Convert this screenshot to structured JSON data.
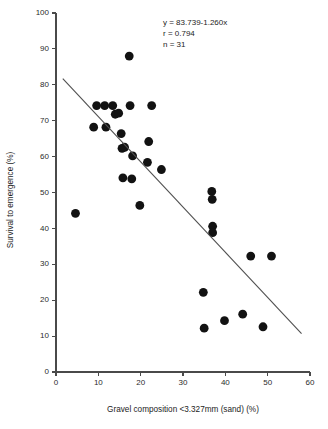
{
  "chart_data": {
    "type": "scatter",
    "title": "",
    "xlabel": "Gravel composition <3.327mm (sand) (%)",
    "ylabel": "Survival to emergence (%)",
    "xlim": [
      0,
      60
    ],
    "ylim": [
      0,
      100
    ],
    "xticks": [
      0,
      10,
      20,
      30,
      40,
      50,
      60
    ],
    "yticks": [
      0,
      10,
      20,
      30,
      40,
      50,
      60,
      70,
      80,
      90,
      100
    ],
    "grid": false,
    "legend": null,
    "marker": {
      "shape": "circle",
      "color": "#121212",
      "size": 4.4
    },
    "points": [
      {
        "x": 4.6,
        "y": 44.2
      },
      {
        "x": 8.9,
        "y": 68.2
      },
      {
        "x": 9.6,
        "y": 74.2
      },
      {
        "x": 11.5,
        "y": 74.2
      },
      {
        "x": 11.8,
        "y": 68.2
      },
      {
        "x": 13.4,
        "y": 74.2
      },
      {
        "x": 14.0,
        "y": 71.8
      },
      {
        "x": 14.8,
        "y": 72.1
      },
      {
        "x": 15.4,
        "y": 66.4
      },
      {
        "x": 15.6,
        "y": 62.3
      },
      {
        "x": 15.8,
        "y": 54.1
      },
      {
        "x": 16.2,
        "y": 62.6
      },
      {
        "x": 17.3,
        "y": 88.0
      },
      {
        "x": 17.5,
        "y": 74.2
      },
      {
        "x": 17.9,
        "y": 53.8
      },
      {
        "x": 18.1,
        "y": 60.2
      },
      {
        "x": 19.8,
        "y": 46.4
      },
      {
        "x": 21.6,
        "y": 58.4
      },
      {
        "x": 21.9,
        "y": 64.2
      },
      {
        "x": 22.6,
        "y": 74.2
      },
      {
        "x": 24.9,
        "y": 56.4
      },
      {
        "x": 34.8,
        "y": 22.2
      },
      {
        "x": 35.0,
        "y": 12.2
      },
      {
        "x": 36.8,
        "y": 50.3
      },
      {
        "x": 36.9,
        "y": 48.1
      },
      {
        "x": 37.0,
        "y": 40.6
      },
      {
        "x": 37.0,
        "y": 38.8
      },
      {
        "x": 39.8,
        "y": 14.3
      },
      {
        "x": 44.1,
        "y": 16.1
      },
      {
        "x": 46.0,
        "y": 32.3
      },
      {
        "x": 48.9,
        "y": 12.6
      },
      {
        "x": 50.9,
        "y": 32.3
      }
    ],
    "fit_line": {
      "equation": "y = 83.739-1.260x",
      "slope": -1.26,
      "intercept": 83.739,
      "x_start": 1.6,
      "x_end": 58.0,
      "color": "#4f4f4f"
    },
    "annotations": {
      "equation": "y = 83.739-1.260x",
      "correlation": "r = 0.794",
      "sample_size": "n = 31",
      "x": 36.0,
      "y": 96.0
    }
  }
}
